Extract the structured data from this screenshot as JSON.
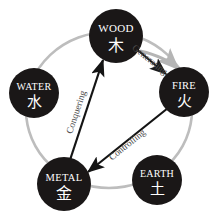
{
  "diagram": {
    "ring_color": "#bdbdbd",
    "node_fill": "#1a1717",
    "node_text_color": "#ffffff",
    "edge_label_color": "#4a4a4a",
    "arrow_color": "#141414",
    "generating_arc_color": "#b5b5b5",
    "background": "#ffffff",
    "nodes": [
      {
        "id": "wood",
        "label": "WOOD",
        "glyph": "木",
        "cx": 116,
        "cy": 36,
        "r": 27
      },
      {
        "id": "fire",
        "label": "FIRE",
        "glyph": "火",
        "cx": 184,
        "cy": 92,
        "r": 25
      },
      {
        "id": "earth",
        "label": "EARTH",
        "glyph": "土",
        "cx": 157,
        "cy": 180,
        "r": 25
      },
      {
        "id": "metal",
        "label": "METAL",
        "glyph": "金",
        "cx": 64,
        "cy": 184,
        "r": 27
      },
      {
        "id": "water",
        "label": "WATER",
        "glyph": "水",
        "cx": 34,
        "cy": 93,
        "r": 25
      }
    ],
    "edges": [
      {
        "id": "generating",
        "label": "Generating",
        "from": "wood",
        "to": "fire",
        "style": "gray-arc-arrow",
        "label_rotation": 39
      },
      {
        "id": "controlling",
        "label": "Controlling",
        "from": "fire",
        "to": "metal",
        "style": "black-arrow",
        "label_rotation": -41
      },
      {
        "id": "conquering",
        "label": "Conquering",
        "from": "metal",
        "to": "wood",
        "style": "black-arrow",
        "label_rotation": -73
      }
    ],
    "ring": {
      "cx": 109,
      "cy": 110,
      "rx": 83,
      "ry": 78
    }
  }
}
